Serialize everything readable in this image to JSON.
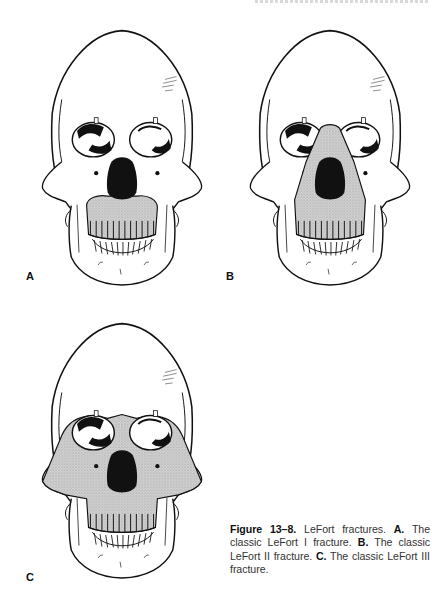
{
  "page": {
    "header_fragment": "",
    "figure": {
      "number_label": "Figure 13–8.",
      "title": " LeFort fractures. ",
      "parts": [
        {
          "label": "A.",
          "text": " The classic LeFort I fracture. "
        },
        {
          "label": "B.",
          "text": " The classic LeFort II fracture. "
        },
        {
          "label": "C.",
          "text": " The classic LeFort III fracture."
        }
      ]
    },
    "panels": [
      {
        "label": "A",
        "description": "Skull frontal view, LeFort I fracture (maxillary alveolar segment shaded)"
      },
      {
        "label": "B",
        "description": "Skull frontal view, LeFort II fracture (pyramidal nasomaxillary segment shaded)"
      },
      {
        "label": "C",
        "description": "Skull frontal view, LeFort III fracture (craniofacial disjunction, whole midface shaded)"
      }
    ],
    "colors": {
      "ink": "#111111",
      "shade": "#b8b8b8",
      "paper": "#ffffff"
    }
  }
}
